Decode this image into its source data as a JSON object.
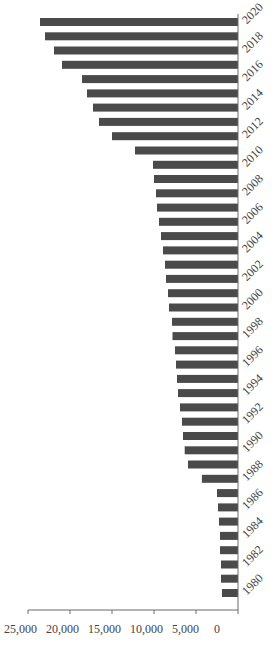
{
  "chart_data": {
    "type": "bar",
    "orientation": "vertical bars, whole chart rotated 90 degrees clockwise",
    "title": "",
    "xlabel": "",
    "ylabel": "",
    "ylim": [
      0,
      25000
    ],
    "yticks": [
      0,
      5000,
      10000,
      15000,
      20000,
      25000
    ],
    "ytick_labels": [
      "0",
      "5,000",
      "10,000",
      "15,000",
      "20,000",
      "25,000"
    ],
    "xtick_labels": [
      "1980",
      "1982",
      "1984",
      "1986",
      "1988",
      "1990",
      "1992",
      "1994",
      "1996",
      "1998",
      "2000",
      "2002",
      "2004",
      "2006",
      "2008",
      "2010",
      "2012",
      "2014",
      "2016",
      "2018",
      "2020"
    ],
    "grid": false,
    "legend": null,
    "bar_color": "#4a4a4a",
    "categories": [
      "1980",
      "1981",
      "1982",
      "1983",
      "1984",
      "1985",
      "1986",
      "1987",
      "1988",
      "1989",
      "1990",
      "1991",
      "1992",
      "1993",
      "1994",
      "1995",
      "1996",
      "1997",
      "1998",
      "1999",
      "2000",
      "2001",
      "2002",
      "2003",
      "2004",
      "2005",
      "2006",
      "2007",
      "2008",
      "2009",
      "2010",
      "2011",
      "2012",
      "2013",
      "2014",
      "2015",
      "2016",
      "2017",
      "2018",
      "2019",
      "2020"
    ],
    "values": [
      1900,
      2020,
      2020,
      2140,
      2140,
      2260,
      2380,
      2500,
      4300,
      5950,
      6350,
      6550,
      6670,
      6900,
      7140,
      7260,
      7380,
      7500,
      7800,
      7860,
      8210,
      8330,
      8570,
      8690,
      8930,
      9170,
      9400,
      9640,
      9760,
      10000,
      10120,
      12260,
      15000,
      16550,
      17260,
      17980,
      18570,
      20950,
      21900,
      22980,
      23570
    ]
  }
}
